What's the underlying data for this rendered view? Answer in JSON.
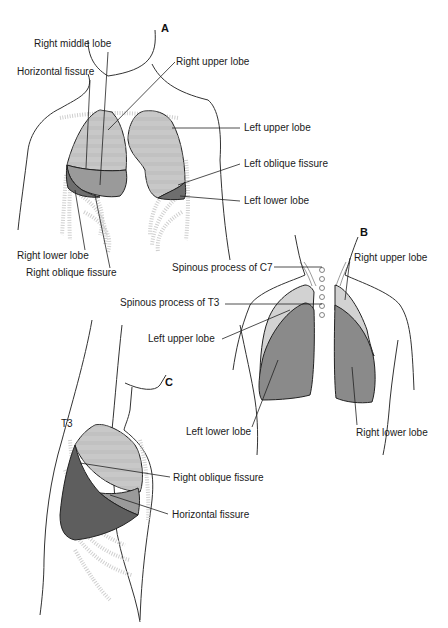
{
  "colors": {
    "upper_lobe_fill": "#c8c8c8",
    "middle_lobe_fill": "#9a9a9a",
    "lower_lobe_fill": "#7c7c7c",
    "back_lower_fill": "#8a8a8a",
    "back_upper_fill": "#d2d2d2",
    "rib_color": "#cfcfcf",
    "outline": "#222222"
  },
  "panels": {
    "A": {
      "letter": "A",
      "view": "anterior",
      "labels": {
        "right_middle_lobe": "Right middle lobe",
        "horizontal_fissure": "Horizontal fissure",
        "right_upper_lobe": "Right upper lobe",
        "left_upper_lobe": "Left upper lobe",
        "left_oblique_fissure": "Left oblique fissure",
        "left_lower_lobe": "Left lower lobe",
        "right_lower_lobe": "Right lower lobe",
        "right_oblique_fissure": "Right oblique fissure"
      }
    },
    "B": {
      "letter": "B",
      "view": "posterior",
      "labels": {
        "spinous_c7": "Spinous process of C7",
        "right_upper_lobe": "Right upper lobe",
        "spinous_t3": "Spinous process of T3",
        "left_upper_lobe": "Left upper lobe",
        "left_lower_lobe": "Left lower lobe",
        "right_lower_lobe": "Right lower lobe"
      }
    },
    "C": {
      "letter": "C",
      "view": "right lateral",
      "labels": {
        "t3": "T3",
        "right_oblique_fissure": "Right oblique fissure",
        "horizontal_fissure": "Horizontal fissure"
      }
    }
  }
}
